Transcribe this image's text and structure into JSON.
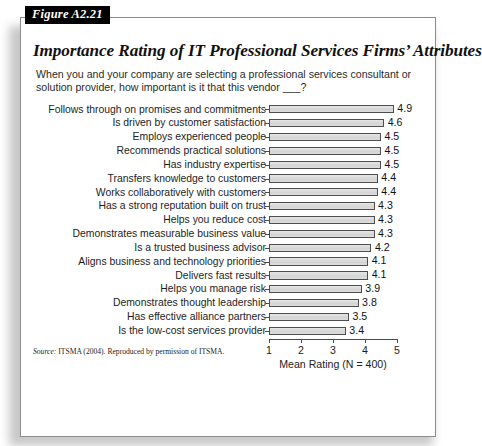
{
  "figure": {
    "tag": "Figure A2.21",
    "title": "Importance Rating of IT Professional Services Firms’ Attributes",
    "subtitle": "When you and your company are selecting a professional services consultant or solution provider, how important is it that this vendor ___?",
    "source_prefix": "Source:",
    "source_text": "ITSMA (2004). Reproduced by permission of ITSMA."
  },
  "chart_data": {
    "type": "bar",
    "orientation": "horizontal",
    "title": "Importance Rating of IT Professional Services Firms’ Attributes",
    "subtitle": "When you and your company are selecting a professional services consultant or solution provider, how important is it that this vendor ___?",
    "xlabel": "Mean Rating (N = 400)",
    "ylabel": "",
    "xlim": [
      1,
      5
    ],
    "xticks": [
      "1",
      "2",
      "3",
      "4",
      "5"
    ],
    "grid": false,
    "legend": "none",
    "sample_size": 400,
    "bar_color": "#d9d9d9",
    "bar_border_color": "#4d4d4d",
    "categories": [
      "Follows through on promises and commitments",
      "Is driven by customer satisfaction",
      "Employs experienced people",
      "Recommends practical solutions",
      "Has industry expertise",
      "Transfers knowledge to customers",
      "Works collaboratively with customers",
      "Has a strong reputation built on trust",
      "Helps you reduce cost",
      "Demonstrates measurable business value",
      "Is a trusted business advisor",
      "Aligns business and technology priorities",
      "Delivers fast results",
      "Helps you manage risk",
      "Demonstrates thought leadership",
      "Has effective alliance partners",
      "Is the low-cost services provider"
    ],
    "values": [
      4.9,
      4.6,
      4.5,
      4.5,
      4.5,
      4.4,
      4.4,
      4.3,
      4.3,
      4.3,
      4.2,
      4.1,
      4.1,
      3.9,
      3.8,
      3.5,
      3.4
    ],
    "value_labels": [
      "4.9",
      "4.6",
      "4.5",
      "4.5",
      "4.5",
      "4.4",
      "4.4",
      "4.3",
      "4.3",
      "4.3",
      "4.2",
      "4.1",
      "4.1",
      "3.9",
      "3.8",
      "3.5",
      "3.4"
    ]
  }
}
